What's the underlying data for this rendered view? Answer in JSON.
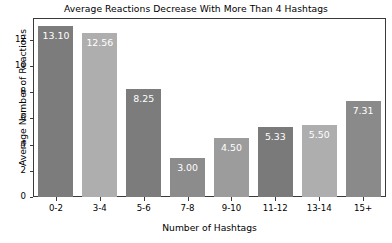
{
  "chart_data": {
    "type": "bar",
    "title": "Average Reactions Decrease With More Than 4 Hashtags",
    "xlabel": "Number of Hashtags",
    "ylabel": "Average Number of Reactions",
    "categories": [
      "0-2",
      "3-4",
      "5-6",
      "7-8",
      "9-10",
      "11-12",
      "13-14",
      "15+"
    ],
    "values": [
      13.1,
      12.56,
      8.25,
      3.0,
      4.5,
      5.33,
      5.5,
      7.31
    ],
    "value_labels": [
      "13.10",
      "12.56",
      "8.25",
      "3.00",
      "4.50",
      "5.33",
      "5.50",
      "7.31"
    ],
    "bar_colors": [
      "#7c7c7c",
      "#aeaeae",
      "#7c7c7c",
      "#8c8c8c",
      "#9c9c9c",
      "#7a7a7a",
      "#aeaeae",
      "#8a8a8a"
    ],
    "value_label_color": "#ffffff",
    "ylim": [
      0,
      13.6
    ],
    "yticks": [
      0,
      2,
      4,
      6,
      8,
      10,
      12
    ],
    "ytick_labels": [
      "0",
      "2",
      "4",
      "6",
      "8",
      "10",
      "12"
    ],
    "grid": false,
    "legend": null,
    "axis_color": "#3a3a3a",
    "background": "#ffffff"
  }
}
